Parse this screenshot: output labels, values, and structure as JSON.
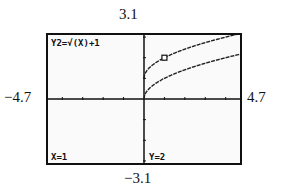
{
  "window": {
    "ymax": "3.1",
    "ymin": "−3.1",
    "xmin": "−4.7",
    "xmax": "4.7"
  },
  "screen": {
    "equation": "Y2=√(X)+1",
    "cursor_x": "X=1",
    "cursor_y": "Y=2"
  },
  "chart_data": {
    "type": "line",
    "title": "",
    "xlabel": "",
    "ylabel": "",
    "xlim": [
      -4.7,
      4.7
    ],
    "ylim": [
      -3.1,
      3.1
    ],
    "grid": false,
    "tick_step": 1,
    "series": [
      {
        "name": "Y1=√(X)",
        "x": [
          0,
          0.25,
          0.5,
          1,
          1.5,
          2,
          2.5,
          3,
          3.5,
          4,
          4.5,
          4.7
        ],
        "values": [
          0,
          0.5,
          0.71,
          1,
          1.22,
          1.41,
          1.58,
          1.73,
          1.87,
          2,
          2.12,
          2.17
        ]
      },
      {
        "name": "Y2=√(X)+1",
        "x": [
          0,
          0.25,
          0.5,
          1,
          1.5,
          2,
          2.5,
          3,
          3.5,
          4,
          4.5,
          4.7
        ],
        "values": [
          1,
          1.5,
          1.71,
          2,
          2.22,
          2.41,
          2.58,
          2.73,
          2.87,
          3,
          3.12,
          3.17
        ]
      }
    ],
    "trace_cursor": {
      "x": 1,
      "y": 2,
      "series": "Y2=√(X)+1"
    },
    "annotations": [
      "Y2=√(X)+1",
      "X=1",
      "Y=2"
    ]
  }
}
